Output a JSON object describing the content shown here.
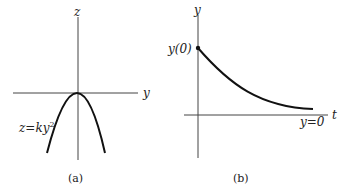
{
  "panels": [
    {
      "caption": "(a)",
      "vertical_axis_label": "z",
      "horizontal_axis_label": "y",
      "curve_label": "z=ky",
      "curve_label_exponent": "2",
      "curve": "downward parabola with vertex at origin"
    },
    {
      "caption": "(b)",
      "vertical_axis_label": "y",
      "horizontal_axis_label": "t",
      "initial_value_label": "y(0)",
      "asymptote_label": "y=0",
      "curve": "exponential decay from y(0) toward y=0"
    }
  ]
}
